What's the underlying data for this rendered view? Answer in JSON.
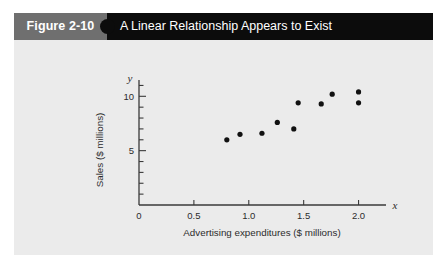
{
  "figure": {
    "number_label": "Figure 2-10",
    "title": "A Linear Relationship Appears to Exist",
    "header_bg": "#0c0c0c",
    "tab_bg": "#6f6f6f",
    "body_bg": "#ebebeb"
  },
  "chart_data": {
    "type": "scatter",
    "title": "A Linear Relationship Appears to Exist",
    "xlabel": "Advertising expenditures ($ millions)",
    "ylabel": "Sales ($ millions)",
    "x_var_symbol": "x",
    "y_var_symbol": "y",
    "xlim": [
      0,
      2.25
    ],
    "ylim": [
      0,
      11.5
    ],
    "x_ticks": [
      0,
      0.5,
      1.0,
      1.5,
      2.0
    ],
    "x_tick_labels": [
      "0",
      "0.5",
      "1.0",
      "1.5",
      "2.0"
    ],
    "y_ticks": [
      1,
      2,
      3,
      4,
      5,
      6,
      7,
      8,
      9,
      10,
      11
    ],
    "y_tick_labels": [
      "",
      "",
      "",
      "",
      "5",
      "",
      "",
      "",
      "",
      "10",
      ""
    ],
    "y_labeled_ticks": [
      5,
      10
    ],
    "grid": false,
    "legend": false,
    "marker": "filled-circle",
    "marker_color": "#111111",
    "points": [
      {
        "x": 0.8,
        "y": 6.0
      },
      {
        "x": 0.92,
        "y": 6.5
      },
      {
        "x": 1.12,
        "y": 6.6
      },
      {
        "x": 1.26,
        "y": 7.6
      },
      {
        "x": 1.41,
        "y": 7.0
      },
      {
        "x": 1.45,
        "y": 9.4
      },
      {
        "x": 1.66,
        "y": 9.3
      },
      {
        "x": 1.76,
        "y": 10.2
      },
      {
        "x": 2.0,
        "y": 10.4
      },
      {
        "x": 2.0,
        "y": 9.4
      }
    ]
  }
}
